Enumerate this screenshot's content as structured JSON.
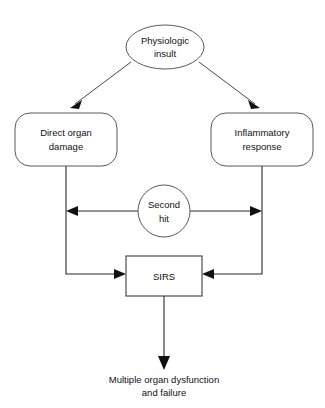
{
  "diagram": {
    "background_color": "#ffffff",
    "stroke_color": "#2b2b2b",
    "shape_stroke_color": "#5a5a5a",
    "text_color": "#111111",
    "nodes": {
      "insult": {
        "shape": "ellipse",
        "line1": "Physiologic",
        "line2": "insult"
      },
      "direct_organ_damage": {
        "shape": "rounded-rectangle",
        "line1": "Direct organ",
        "line2": "damage"
      },
      "inflammatory_response": {
        "shape": "rounded-rectangle",
        "line1": "Inflammatory",
        "line2": "response"
      },
      "second_hit": {
        "shape": "circle",
        "line1": "Second",
        "line2": "hit"
      },
      "sirs": {
        "shape": "rectangle",
        "label": "SIRS"
      },
      "outcome": {
        "shape": "text",
        "line1": "Multiple organ dysfunction",
        "line2": "and failure"
      }
    },
    "edges": [
      {
        "name": "insult-to-direct-organ-damage",
        "from": "insult",
        "to": "direct_organ_damage",
        "style": "diagonal-arrow"
      },
      {
        "name": "insult-to-inflammatory-response",
        "from": "insult",
        "to": "inflammatory_response",
        "style": "diagonal-arrow"
      },
      {
        "name": "second-hit-to-left-branch",
        "from": "second_hit",
        "to": "direct_organ_damage",
        "style": "horizontal-arrow-left"
      },
      {
        "name": "second-hit-to-right-branch",
        "from": "second_hit",
        "to": "inflammatory_response",
        "style": "horizontal-arrow-right"
      },
      {
        "name": "direct-organ-damage-to-sirs",
        "from": "direct_organ_damage",
        "to": "sirs",
        "style": "elbow-arrow"
      },
      {
        "name": "inflammatory-response-to-sirs",
        "from": "inflammatory_response",
        "to": "sirs",
        "style": "elbow-arrow"
      },
      {
        "name": "sirs-to-outcome",
        "from": "sirs",
        "to": "outcome",
        "style": "vertical-arrow"
      }
    ]
  }
}
